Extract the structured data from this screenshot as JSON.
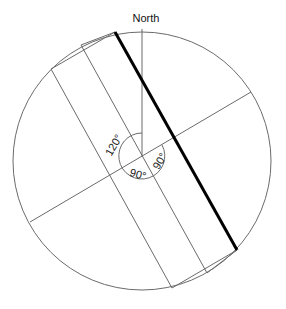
{
  "diagram": {
    "title": "North",
    "angle_labels": {
      "a120": "120°",
      "a90_right": "90°",
      "a90_bottom": "90°"
    },
    "colors": {
      "line": "#6b6b6b",
      "bold_line": "#000000",
      "background": "#ffffff"
    }
  }
}
